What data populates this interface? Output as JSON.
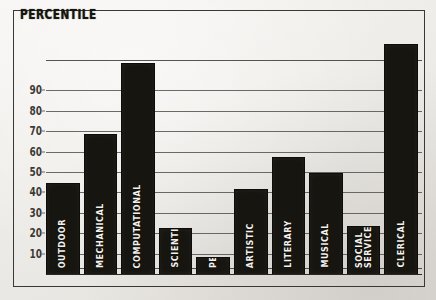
{
  "chart_data": {
    "type": "bar",
    "title": "PERCENTILE",
    "xlabel": "",
    "ylabel": "PERCENTILE",
    "ylim": [
      0,
      120
    ],
    "grid": true,
    "legend": "none",
    "orientation": "vertical",
    "bar_color": "#17150f",
    "label_color": "#f4f2ee",
    "background_color": "#efedea",
    "yticks": [
      10,
      20,
      30,
      40,
      50,
      60,
      70,
      80,
      90
    ],
    "ytick_labels": [
      "10",
      "20",
      "30",
      "40",
      "50",
      "60",
      "70",
      "80",
      "90"
    ],
    "categories": [
      "OUTDOOR",
      "MECHANICAL",
      "COMPUTATIONAL",
      "SCIENTIFIC",
      "PERSUASIVE",
      "ARTISTIC",
      "LITERARY",
      "MUSICAL",
      "SOCIAL\nSERVICE",
      "CLERICAL"
    ],
    "category_labels_display": [
      "OUTDOOR",
      "MECHANICAL",
      "COMPUTATIONAL",
      "SCIENTIFIC",
      "PERSUASIVE",
      "ARTISTIC",
      "LITERARY",
      "MUSICAL",
      "SOCIAL SERVICE",
      "CLERICAL"
    ],
    "values": [
      45,
      69,
      104,
      23,
      9,
      42,
      58,
      50,
      24,
      113
    ]
  },
  "meta": {
    "title_text": "PERCENTILE"
  }
}
